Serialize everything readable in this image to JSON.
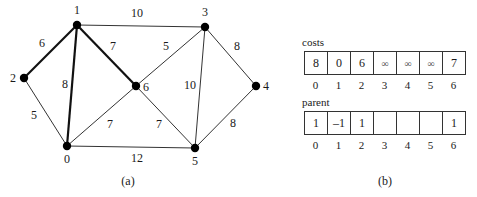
{
  "graph": {
    "nodes": [
      {
        "id": "0",
        "label": "0",
        "x": 67,
        "y": 146,
        "lx": 67,
        "ly": 163
      },
      {
        "id": "1",
        "label": "1",
        "x": 77,
        "y": 25,
        "lx": 77,
        "ly": 14
      },
      {
        "id": "2",
        "label": "2",
        "x": 24,
        "y": 78,
        "lx": 13,
        "ly": 82
      },
      {
        "id": "3",
        "label": "3",
        "x": 205,
        "y": 27,
        "lx": 205,
        "ly": 16
      },
      {
        "id": "4",
        "label": "4",
        "x": 256,
        "y": 86,
        "lx": 266,
        "ly": 90
      },
      {
        "id": "5",
        "label": "5",
        "x": 195,
        "y": 148,
        "lx": 195,
        "ly": 165
      },
      {
        "id": "6",
        "label": "6",
        "x": 136,
        "y": 86,
        "lx": 146,
        "ly": 91
      }
    ],
    "edges": [
      {
        "from": "1",
        "to": "2",
        "weight": "6",
        "bold": true,
        "wx": 42,
        "wy": 47
      },
      {
        "from": "1",
        "to": "0",
        "weight": "8",
        "bold": true,
        "wx": 65,
        "wy": 88
      },
      {
        "from": "1",
        "to": "6",
        "weight": "7",
        "bold": true,
        "wx": 113,
        "wy": 50
      },
      {
        "from": "1",
        "to": "3",
        "weight": "10",
        "bold": false,
        "wx": 137,
        "wy": 17
      },
      {
        "from": "2",
        "to": "0",
        "weight": "5",
        "bold": false,
        "wx": 34,
        "wy": 119
      },
      {
        "from": "0",
        "to": "6",
        "weight": "7",
        "bold": false,
        "wx": 110,
        "wy": 128
      },
      {
        "from": "0",
        "to": "5",
        "weight": "12",
        "bold": false,
        "wx": 137,
        "wy": 162
      },
      {
        "from": "6",
        "to": "3",
        "weight": "5",
        "bold": false,
        "wx": 166,
        "wy": 50
      },
      {
        "from": "6",
        "to": "5",
        "weight": "7",
        "bold": false,
        "wx": 159,
        "wy": 128
      },
      {
        "from": "3",
        "to": "5",
        "weight": "10",
        "bold": false,
        "wx": 190,
        "wy": 89
      },
      {
        "from": "3",
        "to": "4",
        "weight": "8",
        "bold": false,
        "wx": 237,
        "wy": 50
      },
      {
        "from": "5",
        "to": "4",
        "weight": "8",
        "bold": false,
        "wx": 233,
        "wy": 127
      }
    ],
    "caption": "(a)"
  },
  "costs": {
    "title": "costs",
    "values": [
      "8",
      "0",
      "6",
      "∞",
      "∞",
      "∞",
      "7"
    ],
    "indices": [
      "0",
      "1",
      "2",
      "3",
      "4",
      "5",
      "6"
    ]
  },
  "parent": {
    "title": "parent",
    "values": [
      "1",
      "–1",
      "1",
      "",
      "",
      "",
      "1"
    ],
    "indices": [
      "0",
      "1",
      "2",
      "3",
      "4",
      "5",
      "6"
    ]
  },
  "panel_caption": "(b)",
  "colors": {
    "node": "#000000",
    "edge": "#333333",
    "text": "#1a1a1a",
    "background": "#ffffff"
  }
}
